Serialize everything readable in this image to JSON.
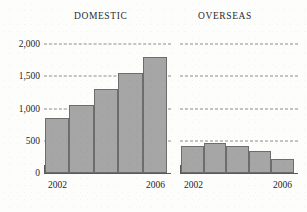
{
  "chart_data": {
    "type": "bar",
    "title": "",
    "xlabel": "",
    "ylabel": "",
    "ylim": [
      0,
      2000
    ],
    "yticks": [
      0,
      500,
      1000,
      1500,
      2000
    ],
    "ytick_labels": [
      "0",
      "500",
      "1,000",
      "1,500",
      "2,000"
    ],
    "grid": true,
    "legend": "none",
    "panels": [
      {
        "title": "DOMESTIC",
        "categories": [
          "2002",
          "2003",
          "2004",
          "2005",
          "2006"
        ],
        "tick_labels_shown": [
          "2002",
          "2006"
        ],
        "values": [
          850,
          1060,
          1300,
          1550,
          1800
        ]
      },
      {
        "title": "OVERSEAS",
        "categories": [
          "2002",
          "2003",
          "2004",
          "2005",
          "2006"
        ],
        "tick_labels_shown": [
          "2002",
          "2006"
        ],
        "values": [
          420,
          470,
          420,
          340,
          210
        ]
      }
    ]
  },
  "panels": {
    "domestic": {
      "title": "DOMESTIC",
      "x_first": "2002",
      "x_last": "2006"
    },
    "overseas": {
      "title": "OVERSEAS",
      "x_first": "2002",
      "x_last": "2006"
    }
  },
  "axis": {
    "ticks": [
      {
        "label": "2,000",
        "value": 2000
      },
      {
        "label": "1,500",
        "value": 1500
      },
      {
        "label": "1,000",
        "value": 1000
      },
      {
        "label": "500",
        "value": 500
      },
      {
        "label": "0",
        "value": 0
      }
    ]
  },
  "colors": {
    "bar_fill": "#a6a6a6",
    "bar_border": "#6d6d6d",
    "gridline": "#8c8c8c",
    "axis": "#5a5a5a",
    "background": "#fdfdfc",
    "text": "#1f1f1f"
  }
}
